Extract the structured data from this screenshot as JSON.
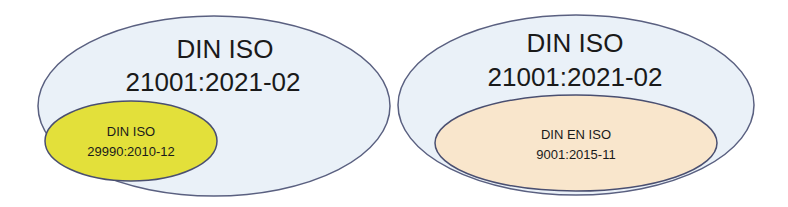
{
  "diagrams": [
    {
      "outer": {
        "line1": "DIN ISO",
        "line2": "21001:2021-02",
        "fill": "#eaf1f8",
        "stroke": "#5a6080"
      },
      "inner": {
        "line1": "DIN ISO",
        "line2": "29990:2010-12",
        "fill": "#e3e03a",
        "stroke": "#4a4f70"
      }
    },
    {
      "outer": {
        "line1": "DIN ISO",
        "line2": "21001:2021-02",
        "fill": "#eaf1f8",
        "stroke": "#5a6080"
      },
      "inner": {
        "line1": "DIN EN ISO",
        "line2": "9001:2015-11",
        "fill": "#f9e6cc",
        "stroke": "#4a4f70"
      }
    }
  ]
}
